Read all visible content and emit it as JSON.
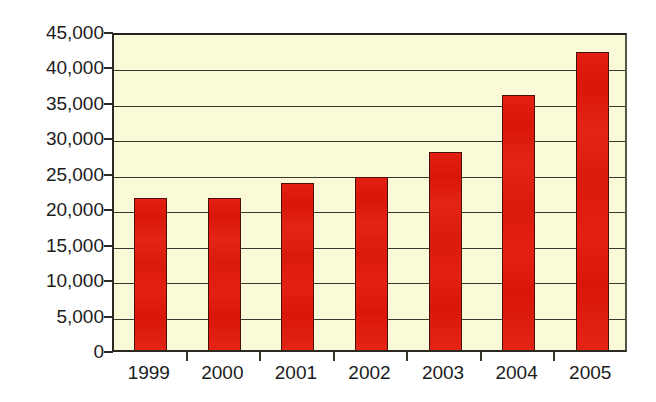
{
  "chart_data": {
    "type": "bar",
    "title": "",
    "subtitle": "",
    "xlabel": "",
    "ylabel": "",
    "categories": [
      "1999",
      "2000",
      "2001",
      "2002",
      "2003",
      "2004",
      "2005"
    ],
    "values": [
      21500,
      21500,
      23600,
      24400,
      28000,
      36000,
      42000
    ],
    "ylim": [
      0,
      45000
    ],
    "ytick_step": 5000,
    "ytick_labels": [
      "0",
      "5,000",
      "10,000",
      "15,000",
      "20,000",
      "25,000",
      "30,000",
      "35,000",
      "40,000",
      "45,000"
    ],
    "ytick_values": [
      0,
      5000,
      10000,
      15000,
      20000,
      25000,
      30000,
      35000,
      40000,
      45000
    ],
    "grid": true,
    "grid_axis": "y",
    "legend": false,
    "legend_position": "none",
    "series": [
      {
        "name": "",
        "values": [
          21500,
          21500,
          23600,
          24400,
          28000,
          36000,
          42000
        ]
      }
    ]
  },
  "style": {
    "bar_color": "#e01b10",
    "bar_outline_color": "#4a1008",
    "plot_background": "#fafad9",
    "page_background": "#ffffff",
    "axis_color": "#2a2a22",
    "grid_color": "#3a3a2c",
    "label_color": "#1c1c1c"
  }
}
